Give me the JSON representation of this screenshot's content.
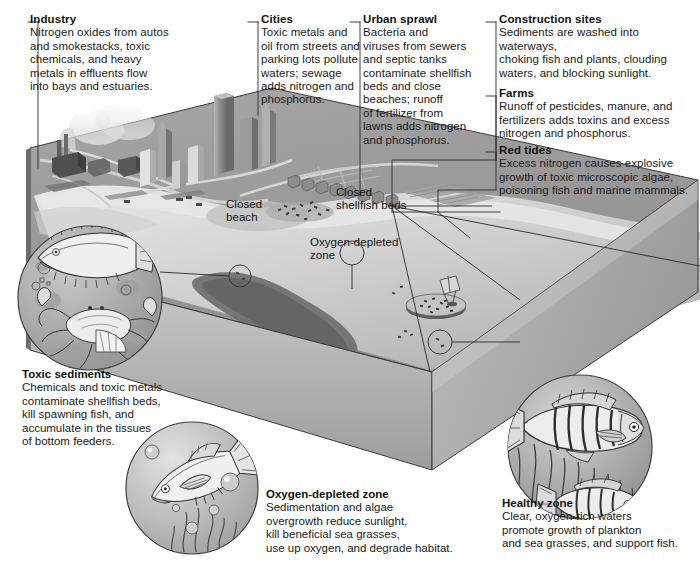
{
  "figure": {
    "colors": {
      "ink": "#1b1b1b",
      "leader_line": "#2a2a2a",
      "land_top": "#9a9a9a",
      "land_side": "#8d8d8d",
      "water_light": "#d8d8d8",
      "water_mid": "#b9b9b9",
      "dead_zone": "#6b6b6b",
      "inset_fill": "#b6b6b6",
      "white": "#ffffff"
    }
  },
  "callouts": [
    {
      "id": "industry",
      "title": "Industry",
      "text": "Nitrogen oxides from autos\nand smokestacks, toxic\nchemicals, and heavy\nmetals in effluents flow\ninto bays and estuaries."
    },
    {
      "id": "cities",
      "title": "Cities",
      "text": "Toxic metals and\noil from streets and\nparking lots pollute\nwaters; sewage\nadds nitrogen and\nphosphorus."
    },
    {
      "id": "urban-sprawl",
      "title": "Urban sprawl",
      "text": "Bacteria and\nviruses from sewers\nand septic tanks\ncontaminate shellfish\nbeds and close\nbeaches; runoff\nof fertilizer from\nlawns adds nitrogen\nand phosphorus."
    },
    {
      "id": "construction-sites",
      "title": "Construction sites",
      "text": "Sediments are washed into waterways,\nchoking fish and plants, clouding\nwaters, and blocking sunlight."
    },
    {
      "id": "farms",
      "title": "Farms",
      "text": "Runoff of pesticides, manure, and\nfertilizers adds toxins and excess\nnitrogen and phosphorus."
    },
    {
      "id": "red-tides",
      "title": "Red tides",
      "text": "Excess nitrogen causes explosive\ngrowth of toxic microscopic algae,\npoisoning fish and marine mammals."
    }
  ],
  "inset_captions": [
    {
      "id": "toxic-sediments",
      "title": "Toxic sediments",
      "text": "Chemicals and toxic metals\ncontaminate shellfish beds,\nkill spawning fish, and\naccumulate in the tissues\nof bottom feeders."
    },
    {
      "id": "oxygen-depleted-zone",
      "title": "Oxygen-depleted zone",
      "text": "Sedimentation and algae\novergrowth reduce sunlight,\nkill beneficial sea grasses,\nuse up oxygen, and degrade habitat."
    },
    {
      "id": "healthy-zone",
      "title": "Healthy zone",
      "text": "Clear, oxygen-rich waters\npromote growth of plankton\nand sea grasses, and support fish."
    }
  ],
  "map_labels": [
    {
      "id": "closed-beach",
      "text": "Closed\nbeach"
    },
    {
      "id": "closed-shellfish-beds",
      "text": "Closed\nshellfish beds"
    },
    {
      "id": "oxygen-depleted-zone-map",
      "text": "Oxygen-depleted\nzone"
    }
  ]
}
